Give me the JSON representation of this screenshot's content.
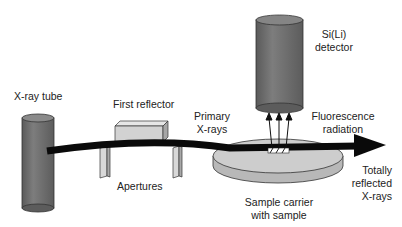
{
  "labels": {
    "xray_tube": "X-ray tube",
    "first_reflector": "First reflector",
    "primary_xrays_1": "Primary",
    "primary_xrays_2": "X-rays",
    "detector_1": "Si(Li)",
    "detector_2": "detector",
    "fluorescence_1": "Fluorescence",
    "fluorescence_2": "radiation",
    "apertures": "Apertures",
    "sample_carrier_1": "Sample carrier",
    "sample_carrier_2": "with sample",
    "reflected_1": "Totally",
    "reflected_2": "reflected",
    "reflected_3": "X-rays"
  },
  "colors": {
    "cylinder": "#6e6e6e",
    "beam": "#0a0a0a",
    "reflector": "#d4d4d4",
    "disk": "#c4c4c4"
  }
}
